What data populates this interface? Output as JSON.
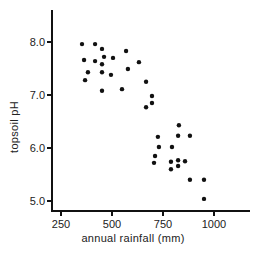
{
  "chart_data": {
    "type": "scatter",
    "title": "",
    "xlabel": "annual rainfall (mm)",
    "ylabel": "topsoil pH",
    "xlim": [
      230,
      1180
    ],
    "ylim": [
      4.8,
      8.6
    ],
    "xticks": [
      250,
      500,
      750,
      1000
    ],
    "xtick_labels": [
      "250",
      "500",
      "750",
      "1000"
    ],
    "yticks": [
      5.0,
      6.0,
      7.0,
      8.0
    ],
    "ytick_labels": [
      "5.0",
      "6.0",
      "7.0",
      "8.0"
    ],
    "grid": false,
    "legend": null,
    "marker_color": "#111111",
    "series": [
      {
        "name": "soil samples",
        "points": [
          [
            353,
            7.96
          ],
          [
            417,
            7.96
          ],
          [
            451,
            7.87
          ],
          [
            569,
            7.83
          ],
          [
            363,
            7.66
          ],
          [
            417,
            7.64
          ],
          [
            461,
            7.72
          ],
          [
            451,
            7.58
          ],
          [
            505,
            7.7
          ],
          [
            578,
            7.49
          ],
          [
            382,
            7.43
          ],
          [
            451,
            7.43
          ],
          [
            495,
            7.38
          ],
          [
            368,
            7.28
          ],
          [
            451,
            7.08
          ],
          [
            549,
            7.11
          ],
          [
            632,
            7.62
          ],
          [
            667,
            7.25
          ],
          [
            696,
            6.98
          ],
          [
            696,
            6.85
          ],
          [
            667,
            6.77
          ],
          [
            828,
            6.43
          ],
          [
            725,
            6.21
          ],
          [
            824,
            6.23
          ],
          [
            882,
            6.23
          ],
          [
            730,
            6.02
          ],
          [
            794,
            6.02
          ],
          [
            711,
            5.85
          ],
          [
            706,
            5.72
          ],
          [
            789,
            5.74
          ],
          [
            824,
            5.77
          ],
          [
            858,
            5.75
          ],
          [
            824,
            5.66
          ],
          [
            789,
            5.6
          ],
          [
            882,
            5.4
          ],
          [
            951,
            5.4
          ],
          [
            951,
            5.04
          ]
        ]
      }
    ]
  }
}
